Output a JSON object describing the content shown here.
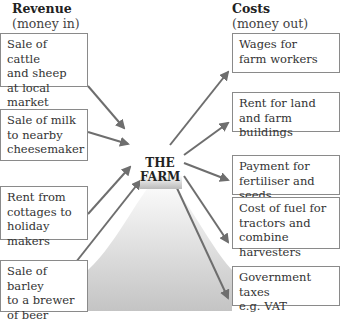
{
  "revenue": {
    "title": "Revenue",
    "subtitle": "(money in)",
    "items": [
      {
        "line1": "Sale of cattle",
        "line2": "and sheep",
        "line3": "at local market"
      },
      {
        "line1": "Sale of milk",
        "line2": "to nearby",
        "line3": "cheesemaker"
      },
      {
        "line1": "Rent from",
        "line2": "cottages to",
        "line3": "holiday makers"
      },
      {
        "line1": "Sale of barley",
        "line2": "to a brewer",
        "line3": "of beer"
      }
    ]
  },
  "costs": {
    "title": "Costs",
    "subtitle": "(money out)",
    "items": [
      {
        "line1": "Wages for",
        "line2": "farm workers",
        "line3": ""
      },
      {
        "line1": "Rent for land",
        "line2": "and farm buildings",
        "line3": ""
      },
      {
        "line1": "Payment for",
        "line2": "fertiliser and seeds",
        "line3": ""
      },
      {
        "line1": "Cost of fuel for",
        "line2": "tractors and",
        "line3": "combine harvesters"
      },
      {
        "line1": "Government taxes",
        "line2": "e.g. VAT",
        "line3": ""
      }
    ]
  },
  "center": {
    "line1": "THE",
    "line2": "FARM"
  },
  "colors": {
    "arrow": "#6e6e6e",
    "box_border": "#8a8a8a",
    "gradient_top": "#ffffff",
    "gradient_bottom": "#c8c8c8"
  }
}
